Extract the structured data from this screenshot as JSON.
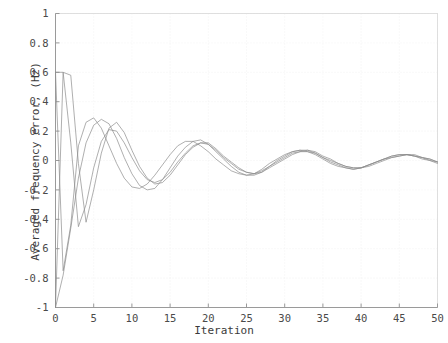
{
  "chart_data": {
    "type": "line",
    "title": "",
    "xlabel": "Iteration",
    "ylabel": "Averaged frequency error, (Hz)",
    "xlim": [
      0,
      50
    ],
    "ylim": [
      -1,
      1
    ],
    "xticks": [
      0,
      5,
      10,
      15,
      20,
      25,
      30,
      35,
      40,
      45,
      50
    ],
    "xtick_labels": [
      "0",
      "5",
      "10",
      "15",
      "20",
      "25",
      "30",
      "35",
      "40",
      "45",
      "50"
    ],
    "yticks": [
      -1,
      -0.8,
      -0.6,
      -0.4,
      -0.2,
      0,
      0.2,
      0.4,
      0.6,
      0.8,
      1
    ],
    "ytick_labels": [
      "-1",
      "-0.8",
      "-0.6",
      "-0.4",
      "-0.2",
      "0",
      "0.2",
      "0.4",
      "0.6",
      "0.8",
      "1"
    ],
    "grid": true,
    "grid_style": "dotted",
    "grid_color": "#f0f0f0",
    "legend": false,
    "legend_position": "none",
    "line_color": "#8c8c8c",
    "line_width": 0.7,
    "axis_color": "#9a9a9a",
    "background": "#ffffff",
    "x": [
      0,
      1,
      2,
      3,
      4,
      5,
      6,
      7,
      8,
      9,
      10,
      11,
      12,
      13,
      14,
      15,
      16,
      17,
      18,
      19,
      20,
      21,
      22,
      23,
      24,
      25,
      26,
      27,
      28,
      29,
      30,
      31,
      32,
      33,
      34,
      35,
      36,
      37,
      38,
      39,
      40,
      41,
      42,
      43,
      44,
      45,
      46,
      47,
      48,
      49,
      50
    ],
    "series": [
      {
        "name": "agent-1",
        "values": [
          -1.0,
          -0.78,
          -0.46,
          -0.12,
          0.12,
          0.24,
          0.28,
          0.25,
          0.15,
          0.02,
          -0.09,
          -0.17,
          -0.2,
          -0.19,
          -0.13,
          -0.05,
          0.03,
          0.09,
          0.13,
          0.14,
          0.11,
          0.06,
          0.01,
          -0.04,
          -0.08,
          -0.1,
          -0.1,
          -0.08,
          -0.04,
          0.0,
          0.03,
          0.06,
          0.07,
          0.07,
          0.05,
          0.02,
          -0.01,
          -0.03,
          -0.05,
          -0.06,
          -0.05,
          -0.03,
          -0.01,
          0.01,
          0.03,
          0.04,
          0.04,
          0.03,
          0.02,
          0.0,
          -0.01
        ]
      },
      {
        "name": "agent-2",
        "values": [
          0.6,
          0.6,
          0.12,
          -0.45,
          -0.3,
          -0.05,
          0.13,
          0.21,
          0.2,
          0.12,
          0.02,
          -0.07,
          -0.13,
          -0.15,
          -0.13,
          -0.08,
          -0.01,
          0.05,
          0.1,
          0.12,
          0.11,
          0.07,
          0.02,
          -0.02,
          -0.06,
          -0.08,
          -0.09,
          -0.07,
          -0.04,
          -0.01,
          0.02,
          0.05,
          0.06,
          0.06,
          0.05,
          0.02,
          0.0,
          -0.02,
          -0.04,
          -0.05,
          -0.05,
          -0.03,
          -0.01,
          0.01,
          0.02,
          0.03,
          0.04,
          0.03,
          0.02,
          0.01,
          -0.01
        ]
      },
      {
        "name": "agent-3",
        "values": [
          -1.0,
          0.6,
          0.58,
          -0.02,
          -0.42,
          -0.2,
          0.05,
          0.22,
          0.26,
          0.19,
          0.07,
          -0.04,
          -0.12,
          -0.16,
          -0.15,
          -0.1,
          -0.03,
          0.04,
          0.09,
          0.12,
          0.12,
          0.08,
          0.03,
          -0.01,
          -0.05,
          -0.08,
          -0.09,
          -0.08,
          -0.05,
          -0.02,
          0.01,
          0.04,
          0.06,
          0.07,
          0.06,
          0.03,
          0.01,
          -0.02,
          -0.04,
          -0.05,
          -0.05,
          -0.04,
          -0.02,
          0.0,
          0.02,
          0.03,
          0.04,
          0.04,
          0.02,
          0.01,
          -0.01
        ]
      },
      {
        "name": "agent-4",
        "values": [
          0.6,
          -0.75,
          -0.44,
          0.1,
          0.26,
          0.29,
          0.22,
          0.1,
          -0.02,
          -0.12,
          -0.18,
          -0.19,
          -0.16,
          -0.1,
          -0.03,
          0.04,
          0.1,
          0.13,
          0.13,
          0.1,
          0.06,
          0.01,
          -0.03,
          -0.07,
          -0.09,
          -0.1,
          -0.09,
          -0.06,
          -0.02,
          0.01,
          0.04,
          0.06,
          0.07,
          0.06,
          0.04,
          0.01,
          -0.02,
          -0.04,
          -0.05,
          -0.06,
          -0.05,
          -0.03,
          -0.01,
          0.01,
          0.03,
          0.04,
          0.04,
          0.03,
          0.01,
          0.0,
          -0.02
        ]
      }
    ]
  }
}
